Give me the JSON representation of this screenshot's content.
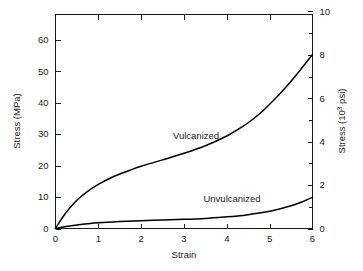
{
  "chart_data": {
    "type": "line",
    "title": "",
    "xlabel": "Strain",
    "ylabel": "Stress (MPa)",
    "y2label_prefix": "Stress (10",
    "y2label_sup": "3",
    "y2label_suffix": " psi)",
    "xlim": [
      0,
      6
    ],
    "ylim": [
      0,
      68
    ],
    "y2lim": [
      0,
      9.86
    ],
    "grid": false,
    "legend_position": "inline-annotations",
    "x_ticks": [
      "0",
      "1",
      "2",
      "3",
      "4",
      "5",
      "6"
    ],
    "x_tick_values": [
      0,
      1,
      2,
      3,
      4,
      5,
      6
    ],
    "y_ticks": [
      "0",
      "10",
      "20",
      "30",
      "40",
      "50",
      "60"
    ],
    "y_tick_values": [
      0,
      10,
      20,
      30,
      40,
      50,
      60
    ],
    "y2_ticks": [
      "0",
      "2",
      "4",
      "6",
      "8",
      "10"
    ],
    "y2_tick_values": [
      0,
      2,
      4,
      6,
      8,
      10
    ],
    "y2_minor_tick_values": [
      1,
      3,
      5,
      7,
      9
    ],
    "series": [
      {
        "name": "Vulcanized",
        "label": "Vulcanized",
        "color": "#000000",
        "x": [
          0,
          0.1,
          0.2,
          0.3,
          0.5,
          0.75,
          1.0,
          1.25,
          1.5,
          1.75,
          2.0,
          2.5,
          3.0,
          3.5,
          4.0,
          4.25,
          4.5,
          4.75,
          5.0,
          5.25,
          5.5,
          5.75,
          6.0
        ],
        "values": [
          0,
          2.2,
          4.2,
          6.0,
          9.0,
          11.8,
          14.0,
          15.8,
          17.3,
          18.6,
          19.8,
          21.8,
          23.9,
          26.3,
          29.4,
          31.4,
          33.6,
          36.3,
          39.5,
          43.0,
          46.8,
          51.0,
          55.3
        ]
      },
      {
        "name": "Unvulcanized",
        "label": "Unvulcanized",
        "color": "#000000",
        "x": [
          0,
          0.25,
          0.5,
          0.75,
          1.0,
          1.5,
          2.0,
          2.5,
          3.0,
          3.5,
          4.0,
          4.25,
          4.5,
          4.75,
          5.0,
          5.25,
          5.5,
          5.75,
          6.0
        ],
        "values": [
          0,
          0.6,
          1.1,
          1.5,
          1.8,
          2.2,
          2.5,
          2.7,
          2.9,
          3.2,
          3.7,
          4.0,
          4.4,
          4.9,
          5.5,
          6.3,
          7.2,
          8.4,
          9.9
        ]
      }
    ],
    "annotations": [
      {
        "text": "Vulcanized",
        "x_px": 196,
        "y_px": 139
      },
      {
        "text": "Unvulcanized",
        "x_px": 232,
        "y_px": 202
      }
    ]
  }
}
